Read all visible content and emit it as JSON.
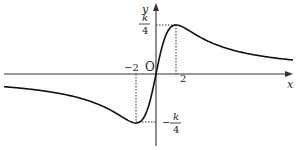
{
  "figure": {
    "type": "function-graph",
    "function_form": "k*x/(x^2+4)",
    "axes": {
      "x_label": "x",
      "y_label": "y",
      "origin_label": "O"
    },
    "tick_labels": {
      "neg_two": "−2",
      "pos_two": "2"
    },
    "extrema": {
      "max": {
        "x": "2",
        "y_num": "k",
        "y_den": "4",
        "sign": ""
      },
      "min": {
        "x": "−2",
        "y_num": "k",
        "y_den": "4",
        "sign": "−"
      }
    },
    "colors": {
      "curve": "#111111",
      "axis": "#333333",
      "guide": "#333333"
    }
  }
}
